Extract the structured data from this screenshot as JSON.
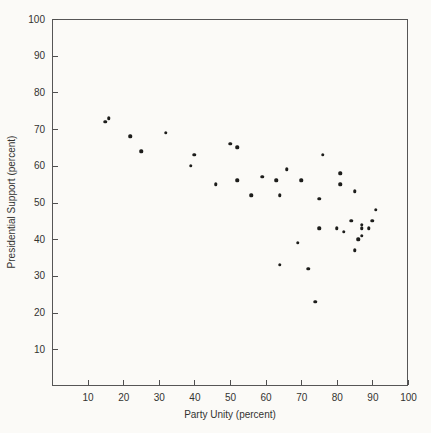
{
  "chart_data": {
    "type": "scatter",
    "title": "",
    "xlabel": "Party Unity (percent)",
    "ylabel": "Presidential Support (percent)",
    "xlim": [
      0,
      100
    ],
    "ylim": [
      0,
      100
    ],
    "x_ticks": [
      10,
      20,
      30,
      40,
      50,
      60,
      70,
      80,
      90,
      100
    ],
    "y_ticks": [
      10,
      20,
      30,
      40,
      50,
      60,
      70,
      80,
      90,
      100
    ],
    "grid": false,
    "legend": false,
    "marker_color": "#1d1d1b",
    "axis_color": "#565656",
    "background_color": "#fbfaf7",
    "points": [
      [
        15,
        72
      ],
      [
        16,
        73
      ],
      [
        22,
        68
      ],
      [
        25,
        64
      ],
      [
        32,
        69
      ],
      [
        39,
        60
      ],
      [
        40,
        63
      ],
      [
        46,
        55
      ],
      [
        50,
        66
      ],
      [
        52,
        65
      ],
      [
        52,
        56
      ],
      [
        56,
        52
      ],
      [
        59,
        57
      ],
      [
        63,
        56
      ],
      [
        64,
        52
      ],
      [
        64,
        33
      ],
      [
        66,
        59
      ],
      [
        69,
        39
      ],
      [
        70,
        56
      ],
      [
        72,
        32
      ],
      [
        74,
        23
      ],
      [
        75,
        51
      ],
      [
        75,
        43
      ],
      [
        76,
        63
      ],
      [
        80,
        43
      ],
      [
        81,
        58
      ],
      [
        81,
        55
      ],
      [
        82,
        42
      ],
      [
        84,
        45
      ],
      [
        85,
        53
      ],
      [
        85,
        37
      ],
      [
        86,
        40
      ],
      [
        87,
        44
      ],
      [
        87,
        43
      ],
      [
        87,
        41
      ],
      [
        89,
        43
      ],
      [
        90,
        45
      ],
      [
        91,
        48
      ]
    ]
  }
}
